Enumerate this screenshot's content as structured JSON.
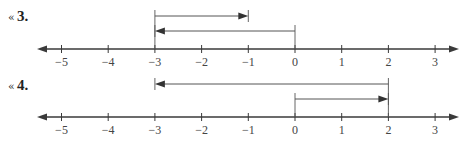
{
  "problems": [
    {
      "marker": "«",
      "number": "3.",
      "axis": {
        "min": -5,
        "max": 3,
        "ticks": [
          "−5",
          "−4",
          "−3",
          "−2",
          "−1",
          "0",
          "1",
          "2",
          "3"
        ]
      },
      "arrows": [
        {
          "from": -3,
          "to": -1,
          "row": 1
        },
        {
          "from": 0,
          "to": -3,
          "row": 2
        }
      ]
    },
    {
      "marker": "«",
      "number": "4.",
      "axis": {
        "min": -5,
        "max": 3,
        "ticks": [
          "−5",
          "−4",
          "−3",
          "−2",
          "−1",
          "0",
          "1",
          "2",
          "3"
        ]
      },
      "arrows": [
        {
          "from": 2,
          "to": -3,
          "row": 1
        },
        {
          "from": 0,
          "to": 2,
          "row": 2
        }
      ]
    }
  ],
  "colors": {
    "axis": "#3a3a3a",
    "arrow": "#555555"
  }
}
